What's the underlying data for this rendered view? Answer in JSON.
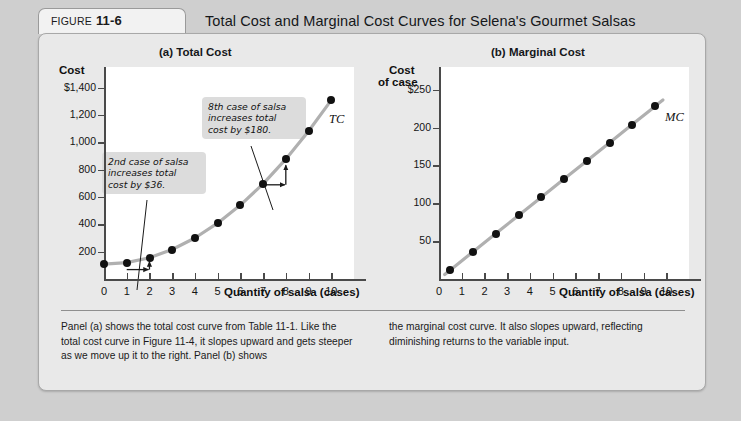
{
  "figure": {
    "tab_label": "FIGURE",
    "tab_number": "11-6",
    "title": "Total Cost and Marginal Cost Curves for Selena's Gourmet Salsas"
  },
  "caption": {
    "left": "Panel (a) shows the total cost curve from Table 11-1. Like the total cost curve in Figure 11-4, it slopes upward and gets steeper as we move up it to the right. Panel (b) shows",
    "right": "the marginal cost curve. It also slopes upward, reflecting diminishing returns to the variable input."
  },
  "annotations": {
    "callout_2nd": "2nd case of salsa\nincreases total\ncost by $36.",
    "callout_8th": "8th case of salsa\nincreases total\ncost by $180."
  },
  "colors": {
    "curve": "#b0b0b0",
    "point": "#111111",
    "axis": "#4a4a4a",
    "panel_bg": "#e9e9e9",
    "plot_bg": "#ffffff",
    "callout_bg": "#dcdcdc",
    "page_bg": "#cfcfcf"
  },
  "chart_data": [
    {
      "type": "line",
      "id": "total-cost",
      "title": "(a) Total Cost",
      "curve_label": "TC",
      "xlabel": "Quantity of salsa (cases)",
      "ylabel": "Cost",
      "ylabel_lines": [
        "Cost"
      ],
      "x": [
        0,
        1,
        2,
        3,
        4,
        5,
        6,
        7,
        8,
        9,
        10
      ],
      "values": [
        108,
        120,
        156,
        216,
        300,
        408,
        540,
        696,
        876,
        1080,
        1308
      ],
      "xticks": [
        0,
        1,
        2,
        3,
        4,
        5,
        6,
        7,
        8,
        9,
        10
      ],
      "xticklabels": [
        "0",
        "1",
        "2",
        "3",
        "4",
        "5",
        "6",
        "7",
        "8",
        "9",
        "10"
      ],
      "yticks": [
        200,
        400,
        600,
        800,
        1000,
        1200,
        1400
      ],
      "yticklabels": [
        "200",
        "400",
        "600",
        "800",
        "1,000",
        "1,200",
        "$1,400"
      ],
      "xlim": [
        0,
        11
      ],
      "ylim": [
        0,
        1550
      ],
      "grid": false,
      "legend": "none"
    },
    {
      "type": "line",
      "id": "marginal-cost",
      "title": "(b) Marginal Cost",
      "curve_label": "MC",
      "xlabel": "Quantity of salsa (cases)",
      "ylabel": "Cost of case",
      "ylabel_lines": [
        "Cost",
        "of case"
      ],
      "x": [
        0.5,
        1.5,
        2.5,
        3.5,
        4.5,
        5.5,
        6.5,
        7.5,
        8.5,
        9.5
      ],
      "values": [
        12,
        36,
        60,
        84,
        108,
        132,
        156,
        180,
        204,
        228
      ],
      "xticks": [
        0,
        1,
        2,
        3,
        4,
        5,
        6,
        7,
        8,
        9,
        10
      ],
      "xticklabels": [
        "0",
        "1",
        "2",
        "3",
        "4",
        "5",
        "6",
        "7",
        "8",
        "9",
        "10"
      ],
      "yticks": [
        50,
        100,
        150,
        200,
        250
      ],
      "yticklabels": [
        "50",
        "100",
        "150",
        "200",
        "$250"
      ],
      "xlim": [
        0,
        11
      ],
      "ylim": [
        0,
        280
      ],
      "grid": false,
      "legend": "none"
    }
  ]
}
